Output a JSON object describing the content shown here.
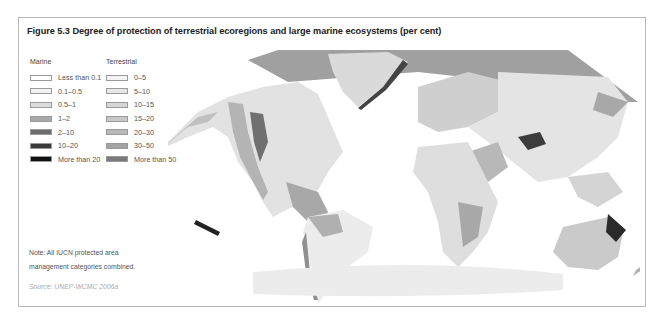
{
  "figure": {
    "title": "Figure 5.3 Degree of protection of terrestrial ecoregions and large marine ecosystems (per cent)",
    "note_line1": "Note: All IUCN protected area",
    "note_line2": "management categories combined.",
    "source": "Source: UNEP-WCMC 2006a"
  },
  "legend": {
    "marine": {
      "heading": "Marine",
      "items": [
        {
          "label": "Less than 0.1",
          "color": "#ffffff"
        },
        {
          "label": "0.1–0.5",
          "color": "#f2f2f2"
        },
        {
          "label": "0.5–1",
          "color": "#dcdcdc"
        },
        {
          "label": "1–2",
          "color": "#a9a9a9"
        },
        {
          "label": "2–10",
          "color": "#6e6e6e"
        },
        {
          "label": "10–20",
          "color": "#3a3a3a"
        },
        {
          "label": "More than 20",
          "color": "#111111"
        }
      ]
    },
    "terrestrial": {
      "heading": "Terrestrial",
      "items": [
        {
          "label": "0–5",
          "color": "#f4f4f4"
        },
        {
          "label": "5–10",
          "color": "#e6e6e6"
        },
        {
          "label": "10–15",
          "color": "#d6d6d6"
        },
        {
          "label": "15–20",
          "color": "#c8c8c8"
        },
        {
          "label": "20–30",
          "color": "#b9b9b9"
        },
        {
          "label": "30–50",
          "color": "#a3a3a3"
        },
        {
          "label": "More than 50",
          "color": "#7a7a7a"
        }
      ]
    }
  },
  "map": {
    "projection": "world, Robinson-like",
    "colors": {
      "ocean": "#ffffff",
      "arctic_marine": "#9e9e9e",
      "land_light": "#e8e8e8",
      "land_mid": "#c8c8c8",
      "land_dark": "#a0a0a0",
      "high_protection": "#333333",
      "antarctica": "#ececec"
    }
  }
}
